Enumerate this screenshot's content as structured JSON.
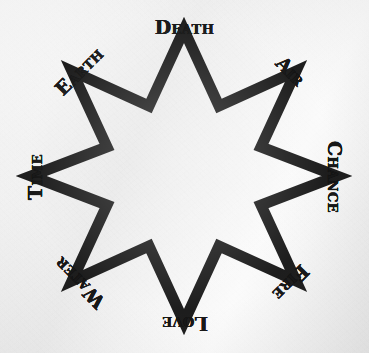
{
  "figure": {
    "kind": "eight-pointed-star-diagram",
    "background_color": "#ededed",
    "ink_color": "#111111",
    "media": "printed-paper-scan"
  },
  "star": {
    "name": "eight-pointed-star",
    "points": 8,
    "construction": "two-overlapping-squares",
    "stroke_color": "#111111",
    "fill_color": "none",
    "stroke_width_px": 11,
    "center_x": 184,
    "center_y": 176,
    "outer_radius_px": 146,
    "inner_radius_px": 99,
    "square_left_px": 87,
    "square_right_px": 283,
    "square_top_px": 83,
    "square_bottom_px": 262,
    "point_top_y_px": 38,
    "point_bottom_y_px": 305,
    "point_left_x_px": 39,
    "point_right_x_px": 320
  },
  "labels": [
    {
      "id": "death",
      "text": "Death",
      "angle": 0,
      "position": "top",
      "script": "blackletter"
    },
    {
      "id": "air",
      "text": "Air",
      "angle": 45,
      "position": "upper-right",
      "script": "blackletter"
    },
    {
      "id": "chance",
      "text": "Chance",
      "angle": 90,
      "position": "right",
      "script": "blackletter"
    },
    {
      "id": "fire",
      "text": "Fire",
      "angle": 135,
      "position": "lower-right",
      "script": "blackletter"
    },
    {
      "id": "love",
      "text": "Love",
      "angle": 180,
      "position": "bottom",
      "script": "blackletter"
    },
    {
      "id": "water",
      "text": "Water",
      "angle": 225,
      "position": "lower-left",
      "script": "blackletter"
    },
    {
      "id": "time",
      "text": "Time",
      "angle": 270,
      "position": "left",
      "script": "blackletter"
    },
    {
      "id": "earth",
      "text": "Earth",
      "angle": 315,
      "position": "upper-left",
      "script": "blackletter"
    }
  ]
}
